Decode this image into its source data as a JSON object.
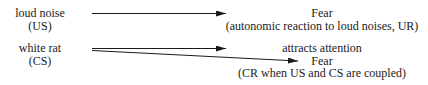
{
  "stimuli": [
    {
      "id": "us",
      "name": "loud noise",
      "type": "(US)"
    },
    {
      "id": "cs",
      "name": "white rat",
      "type": "(CS)"
    }
  ],
  "responses": [
    {
      "id": "ur",
      "title": "Fear",
      "note": "(autonomic reaction to loud noises, UR)"
    },
    {
      "id": "attention",
      "title": "attracts attention"
    },
    {
      "id": "cr",
      "title": "Fear",
      "note": "(CR when US and CS are coupled)"
    }
  ],
  "arrows": [
    {
      "from": "loud noise (US)",
      "to": "Fear (UR)"
    },
    {
      "from": "white rat (CS)",
      "to": "attracts attention"
    },
    {
      "from": "white rat (CS)",
      "to": "Fear (CR)"
    }
  ],
  "colors": {
    "line": "#1a1a1a",
    "text": "#1a1a1a",
    "background": "#ffffff"
  }
}
